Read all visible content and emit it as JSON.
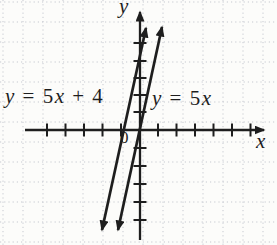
{
  "chart_data": {
    "type": "line",
    "title": "",
    "xlabel": "x",
    "ylabel": "y",
    "origin_label": "0",
    "xlim": [
      -6,
      7
    ],
    "ylim": [
      -6,
      6
    ],
    "grid": true,
    "tick_labels_shown": false,
    "legend_position": "inline-annotations",
    "series": [
      {
        "name": "y = 5x + 4",
        "slope": 5,
        "y_intercept": 4,
        "x_intercept": -0.8,
        "x": [
          -1.9,
          0.4
        ],
        "y": [
          -5.5,
          6.0
        ]
      },
      {
        "name": "y = 5x",
        "slope": 5,
        "y_intercept": 0,
        "x_intercept": 0,
        "x": [
          -1.2,
          1.3
        ],
        "y": [
          -5.8,
          6.0
        ]
      }
    ]
  },
  "labels": {
    "left_line": "y = 5x + 4",
    "right_line": "y = 5x",
    "x_axis": "x",
    "y_axis": "y",
    "origin": "0"
  },
  "colors": {
    "ink": "#1e1e1e",
    "grid": "#c6c9d0",
    "background": "#fcfcfa"
  }
}
